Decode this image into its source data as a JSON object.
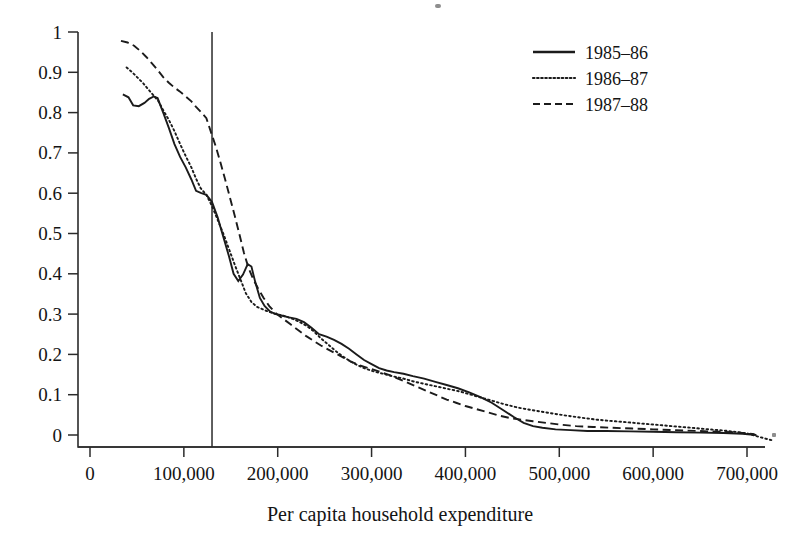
{
  "chart_data": {
    "type": "line",
    "title": "",
    "xlabel": "Per capita household expenditure",
    "ylabel": "",
    "xlim": [
      0,
      765000
    ],
    "ylim": [
      -0.02,
      1.0
    ],
    "grid": false,
    "legend_position": "top-right",
    "x_tick_labels": [
      "0",
      "100,000",
      "200,000",
      "300,000",
      "400,000",
      "500,000",
      "600,000",
      "700,000"
    ],
    "x_tick_values": [
      0,
      100000,
      200000,
      300000,
      400000,
      500000,
      600000,
      700000
    ],
    "y_tick_labels": [
      "0",
      "0.1",
      "0.2",
      "0.3",
      "0.4",
      "0.5",
      "0.6",
      "0.7",
      "0.8",
      "0.9",
      "1"
    ],
    "y_tick_values": [
      0,
      0.1,
      0.2,
      0.3,
      0.4,
      0.5,
      0.6,
      0.7,
      0.8,
      0.9,
      1
    ],
    "annotations": [
      {
        "name": "poverty-line",
        "type": "vline",
        "x": 130000,
        "label": ""
      }
    ],
    "series": [
      {
        "name": "1985–86",
        "style": "solid",
        "color": "#1b1b1b",
        "points": [
          [
            35000,
            0.845
          ],
          [
            41000,
            0.838
          ],
          [
            46000,
            0.818
          ],
          [
            52000,
            0.816
          ],
          [
            58000,
            0.824
          ],
          [
            63000,
            0.834
          ],
          [
            68000,
            0.84
          ],
          [
            72000,
            0.836
          ],
          [
            78000,
            0.8
          ],
          [
            84000,
            0.762
          ],
          [
            90000,
            0.722
          ],
          [
            96000,
            0.69
          ],
          [
            102000,
            0.664
          ],
          [
            108000,
            0.634
          ],
          [
            113000,
            0.606
          ],
          [
            118000,
            0.601
          ],
          [
            124000,
            0.596
          ],
          [
            130000,
            0.578
          ],
          [
            136000,
            0.54
          ],
          [
            142000,
            0.492
          ],
          [
            148000,
            0.444
          ],
          [
            153000,
            0.4
          ],
          [
            158000,
            0.382
          ],
          [
            163000,
            0.398
          ],
          [
            168000,
            0.424
          ],
          [
            172000,
            0.418
          ],
          [
            176000,
            0.38
          ],
          [
            181000,
            0.34
          ],
          [
            186000,
            0.32
          ],
          [
            192000,
            0.306
          ],
          [
            198000,
            0.3
          ],
          [
            205000,
            0.296
          ],
          [
            212000,
            0.292
          ],
          [
            220000,
            0.288
          ],
          [
            228000,
            0.28
          ],
          [
            236000,
            0.266
          ],
          [
            244000,
            0.25
          ],
          [
            252000,
            0.244
          ],
          [
            260000,
            0.236
          ],
          [
            268000,
            0.226
          ],
          [
            276000,
            0.214
          ],
          [
            284000,
            0.2
          ],
          [
            292000,
            0.186
          ],
          [
            300000,
            0.176
          ],
          [
            308000,
            0.166
          ],
          [
            316000,
            0.16
          ],
          [
            324000,
            0.156
          ],
          [
            334000,
            0.152
          ],
          [
            344000,
            0.146
          ],
          [
            356000,
            0.14
          ],
          [
            368000,
            0.132
          ],
          [
            380000,
            0.124
          ],
          [
            392000,
            0.116
          ],
          [
            404000,
            0.106
          ],
          [
            416000,
            0.094
          ],
          [
            428000,
            0.08
          ],
          [
            440000,
            0.062
          ],
          [
            452000,
            0.044
          ],
          [
            462000,
            0.03
          ],
          [
            472000,
            0.022
          ],
          [
            482000,
            0.018
          ],
          [
            496000,
            0.014
          ],
          [
            512000,
            0.012
          ],
          [
            530000,
            0.01
          ],
          [
            550000,
            0.01
          ],
          [
            575000,
            0.009
          ],
          [
            600000,
            0.008
          ],
          [
            625000,
            0.007
          ],
          [
            650000,
            0.006
          ],
          [
            675000,
            0.005
          ],
          [
            695000,
            0.003
          ],
          [
            710000,
            0.0
          ]
        ]
      },
      {
        "name": "1986–87",
        "style": "dotted",
        "color": "#1b1b1b",
        "points": [
          [
            39000,
            0.912
          ],
          [
            45000,
            0.9
          ],
          [
            51000,
            0.886
          ],
          [
            57000,
            0.872
          ],
          [
            62000,
            0.858
          ],
          [
            68000,
            0.842
          ],
          [
            73000,
            0.828
          ],
          [
            78000,
            0.806
          ],
          [
            84000,
            0.782
          ],
          [
            90000,
            0.754
          ],
          [
            96000,
            0.722
          ],
          [
            102000,
            0.692
          ],
          [
            108000,
            0.664
          ],
          [
            113000,
            0.636
          ],
          [
            118000,
            0.612
          ],
          [
            124000,
            0.596
          ],
          [
            130000,
            0.568
          ],
          [
            136000,
            0.534
          ],
          [
            142000,
            0.5
          ],
          [
            148000,
            0.462
          ],
          [
            154000,
            0.424
          ],
          [
            160000,
            0.388
          ],
          [
            166000,
            0.352
          ],
          [
            172000,
            0.33
          ],
          [
            178000,
            0.318
          ],
          [
            184000,
            0.312
          ],
          [
            190000,
            0.306
          ],
          [
            198000,
            0.3
          ],
          [
            206000,
            0.296
          ],
          [
            214000,
            0.29
          ],
          [
            222000,
            0.282
          ],
          [
            230000,
            0.272
          ],
          [
            238000,
            0.258
          ],
          [
            246000,
            0.24
          ],
          [
            254000,
            0.224
          ],
          [
            262000,
            0.208
          ],
          [
            270000,
            0.194
          ],
          [
            278000,
            0.182
          ],
          [
            286000,
            0.172
          ],
          [
            294000,
            0.164
          ],
          [
            302000,
            0.158
          ],
          [
            312000,
            0.152
          ],
          [
            322000,
            0.146
          ],
          [
            334000,
            0.14
          ],
          [
            346000,
            0.132
          ],
          [
            358000,
            0.126
          ],
          [
            370000,
            0.12
          ],
          [
            382000,
            0.114
          ],
          [
            394000,
            0.108
          ],
          [
            406000,
            0.1
          ],
          [
            418000,
            0.092
          ],
          [
            430000,
            0.084
          ],
          [
            442000,
            0.076
          ],
          [
            456000,
            0.068
          ],
          [
            470000,
            0.062
          ],
          [
            486000,
            0.056
          ],
          [
            502000,
            0.05
          ],
          [
            520000,
            0.044
          ],
          [
            540000,
            0.038
          ],
          [
            560000,
            0.034
          ],
          [
            580000,
            0.03
          ],
          [
            600000,
            0.026
          ],
          [
            620000,
            0.022
          ],
          [
            640000,
            0.018
          ],
          [
            660000,
            0.014
          ],
          [
            680000,
            0.01
          ],
          [
            700000,
            0.004
          ],
          [
            715000,
            -0.006
          ],
          [
            728000,
            -0.014
          ]
        ]
      },
      {
        "name": "1987–88",
        "style": "dashed",
        "color": "#1b1b1b",
        "points": [
          [
            33000,
            0.978
          ],
          [
            40000,
            0.974
          ],
          [
            47000,
            0.966
          ],
          [
            54000,
            0.952
          ],
          [
            60000,
            0.938
          ],
          [
            66000,
            0.922
          ],
          [
            72000,
            0.906
          ],
          [
            78000,
            0.888
          ],
          [
            84000,
            0.874
          ],
          [
            90000,
            0.862
          ],
          [
            96000,
            0.852
          ],
          [
            102000,
            0.84
          ],
          [
            108000,
            0.828
          ],
          [
            113000,
            0.814
          ],
          [
            118000,
            0.802
          ],
          [
            124000,
            0.786
          ],
          [
            130000,
            0.744
          ],
          [
            134000,
            0.716
          ],
          [
            139000,
            0.676
          ],
          [
            144000,
            0.634
          ],
          [
            149000,
            0.59
          ],
          [
            154000,
            0.546
          ],
          [
            159000,
            0.5
          ],
          [
            164000,
            0.452
          ],
          [
            169000,
            0.414
          ],
          [
            174000,
            0.386
          ],
          [
            179000,
            0.364
          ],
          [
            185000,
            0.34
          ],
          [
            191000,
            0.32
          ],
          [
            198000,
            0.302
          ],
          [
            206000,
            0.288
          ],
          [
            214000,
            0.274
          ],
          [
            222000,
            0.26
          ],
          [
            230000,
            0.246
          ],
          [
            238000,
            0.234
          ],
          [
            246000,
            0.222
          ],
          [
            254000,
            0.212
          ],
          [
            262000,
            0.202
          ],
          [
            270000,
            0.192
          ],
          [
            278000,
            0.182
          ],
          [
            286000,
            0.174
          ],
          [
            294000,
            0.168
          ],
          [
            302000,
            0.162
          ],
          [
            310000,
            0.156
          ],
          [
            320000,
            0.148
          ],
          [
            330000,
            0.138
          ],
          [
            340000,
            0.128
          ],
          [
            350000,
            0.118
          ],
          [
            360000,
            0.108
          ],
          [
            370000,
            0.098
          ],
          [
            380000,
            0.088
          ],
          [
            390000,
            0.08
          ],
          [
            400000,
            0.072
          ],
          [
            412000,
            0.064
          ],
          [
            424000,
            0.056
          ],
          [
            436000,
            0.048
          ],
          [
            448000,
            0.042
          ],
          [
            460000,
            0.038
          ],
          [
            472000,
            0.034
          ],
          [
            486000,
            0.03
          ],
          [
            500000,
            0.026
          ],
          [
            518000,
            0.022
          ],
          [
            536000,
            0.02
          ],
          [
            556000,
            0.018
          ],
          [
            578000,
            0.016
          ],
          [
            600000,
            0.014
          ],
          [
            624000,
            0.012
          ],
          [
            648000,
            0.01
          ],
          [
            672000,
            0.008
          ],
          [
            692000,
            0.006
          ],
          [
            708000,
            0.002
          ]
        ]
      }
    ],
    "legend": [
      {
        "label": "1985–86",
        "style": "solid"
      },
      {
        "label": "1986–87",
        "style": "dotted"
      },
      {
        "label": "1987–88",
        "style": "dashed"
      }
    ]
  }
}
